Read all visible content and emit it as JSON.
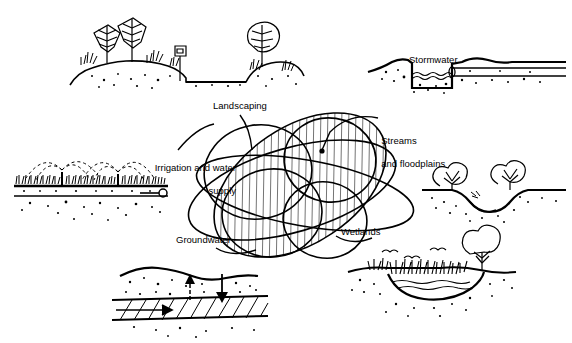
{
  "figure": {
    "type": "venn-overlap-concept-diagram",
    "background_color": "#ffffff",
    "ink_color": "#000000",
    "style": "black-and-white line drawing with hatched overlap region"
  },
  "center_diagram": {
    "name": "overlapping-ellipses",
    "hatched_region_label": "integrated water resources overlap",
    "ellipse_count": 7
  },
  "labels": {
    "landscaping": "Landscaping",
    "streams_line1": "Streams",
    "streams_line2": "and floodplains",
    "irrigation_line1": "Irrigation and water",
    "irrigation_line2": "supply",
    "groundwater": "Groundwater",
    "wetlands": "Wetlands",
    "stormwater": "Stormwater"
  },
  "scenes": [
    {
      "name": "landscaping-scene",
      "description": "trees and shrubs on mounded berms beside a roadway with a mailbox"
    },
    {
      "name": "stormwater-scene",
      "description": "trapezoidal stormwater channel with flowing water and an outfall pipe"
    },
    {
      "name": "irrigation-scene",
      "description": "lawn sprinklers spraying arcs of water over turf above a buried supply pipe"
    },
    {
      "name": "streams-scene",
      "description": "stream channel incised between vegetated banks with shrubs"
    },
    {
      "name": "groundwater-scene",
      "description": "subsurface cross-section of an aquifer with recharge and discharge arrows"
    },
    {
      "name": "wetlands-scene",
      "description": "shallow wetland depression with marsh grasses, a tree and birds overhead"
    }
  ]
}
